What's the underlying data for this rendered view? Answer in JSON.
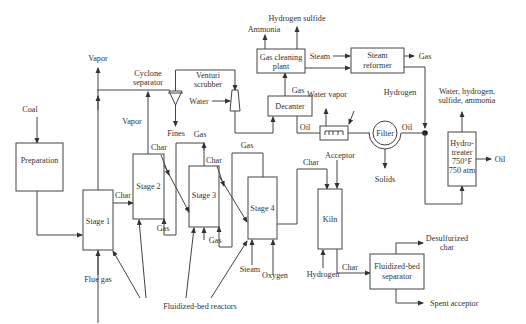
{
  "diagram": {
    "nodes": {
      "preparation": "Preparation",
      "stage1": "Stage 1",
      "stage2": "Stage 2",
      "stage3": "Stage 3",
      "stage4": "Stage 4",
      "cyclone": [
        "Cyclone",
        "separator"
      ],
      "venturi": [
        "Venturi",
        "scrubber"
      ],
      "decanter": "Decanter",
      "gas_cleaning": [
        "Gas cleaning",
        "plant"
      ],
      "steam_reformer": [
        "Steam",
        "reformer"
      ],
      "oil_dehydrator": "Oil dehydrator",
      "filter": "Filter",
      "hydrotreater": [
        "Hydro-",
        "treater",
        "750°F",
        "750 atm"
      ],
      "kiln": "Kiln",
      "fb_separator": [
        "Fluidized-bed",
        "separator"
      ]
    },
    "labels": {
      "coal": "Coal",
      "vapor_top": "Vapor",
      "vapor_mid": "Vapor",
      "fines": "Fines",
      "water": "Water",
      "char_s1_s2": "Char",
      "char_s2_s3": "Char",
      "char_s3_s4": "Char",
      "char_s4_kiln": "Char",
      "char_kiln_sep": "Char",
      "gas_s3_out": "Gas",
      "gas_s4_out": "Gas",
      "gas_s3_to_s2": "Gas",
      "gas_s4_to_s3": "Gas",
      "gas_decanter": "Gas",
      "hydrogen_sulfide": "Hydrogen sulfide",
      "ammonia": "Ammonia",
      "steam_in": "Steam",
      "gas_out": "Gas",
      "water_vapor": "Water vapor",
      "oil_decanter": "Oil",
      "oil_filter": "Oil",
      "oil_out": "Oil",
      "hydrogen": "Hydrogen",
      "hydro_out": [
        "Water, hydrogen,",
        "sulfide, ammonia"
      ],
      "acceptor": "Acceptor",
      "solids": "Solids",
      "flue_gas": "Flue gas",
      "steam_s4": "Steam",
      "oxygen": "Oxygen",
      "hydrogen_kiln": "Hydrogen",
      "desulfurized_char": [
        "Desulfurized",
        "char"
      ],
      "spent_acceptor": "Spent acceptor",
      "fb_reactors": "Fluidized-bed reactors"
    }
  }
}
